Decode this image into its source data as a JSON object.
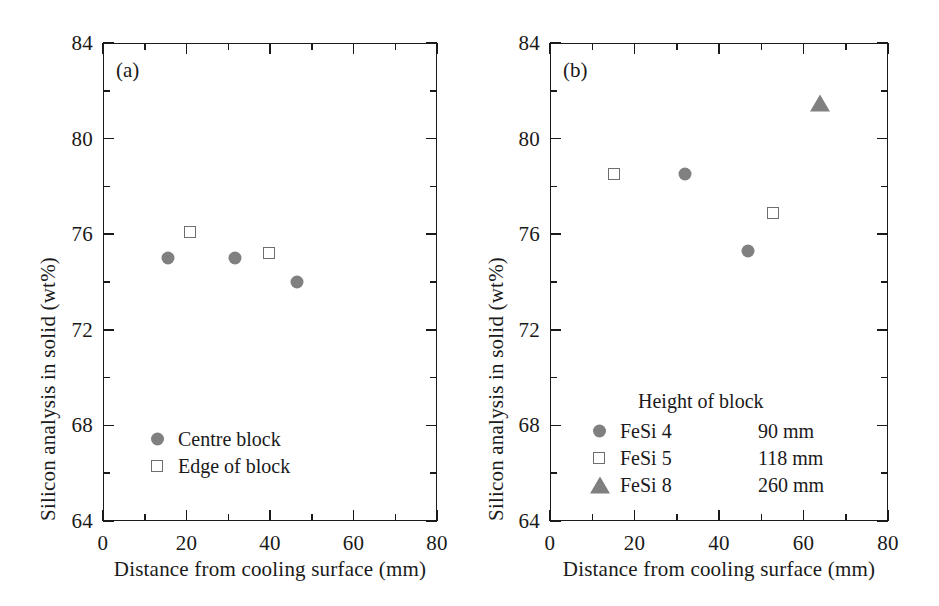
{
  "figure": {
    "panels": [
      {
        "tag": "(a)",
        "xlabel": "Distance from cooling surface (mm)",
        "ylabel": "Silicon analysis in solid (wt%)",
        "xticks": [
          "0",
          "20",
          "40",
          "60",
          "80"
        ],
        "yticks": [
          "64",
          "68",
          "72",
          "76",
          "80",
          "84"
        ],
        "legend": {
          "rows": [
            {
              "symbol": "filled-circle",
              "label": "Centre block"
            },
            {
              "symbol": "open-square",
              "label": "Edge of block"
            }
          ]
        }
      },
      {
        "tag": "(b)",
        "xlabel": "Distance from cooling surface (mm)",
        "ylabel": "Silicon analysis in solid (wt%)",
        "xticks": [
          "0",
          "20",
          "40",
          "60",
          "80"
        ],
        "yticks": [
          "64",
          "68",
          "72",
          "76",
          "80",
          "84"
        ],
        "legend": {
          "header": "Height of block",
          "rows": [
            {
              "symbol": "filled-circle",
              "label": "FeSi 4",
              "value": "90 mm"
            },
            {
              "symbol": "open-square",
              "label": "FeSi 5",
              "value": "118 mm"
            },
            {
              "symbol": "filled-triangle",
              "label": "FeSi 8",
              "value": "260 mm"
            }
          ]
        }
      }
    ]
  },
  "chart_data": [
    {
      "type": "scatter",
      "panel": "(a)",
      "title": "",
      "xlabel": "Distance from cooling surface (mm)",
      "ylabel": "Silicon analysis in solid (wt%)",
      "xlim": [
        0,
        80
      ],
      "ylim": [
        64,
        84
      ],
      "xticks": [
        0,
        20,
        40,
        60,
        80
      ],
      "yticks": [
        64,
        68,
        72,
        76,
        80,
        84
      ],
      "xminor_step": 10,
      "yminor_step": 2,
      "grid": false,
      "legend_position": "lower-left-inside",
      "series": [
        {
          "name": "Centre block",
          "marker": "filled-circle",
          "color": "#808080",
          "x": [
            15.6,
            31.6,
            46.5
          ],
          "y": [
            75.0,
            75.0,
            74.0
          ]
        },
        {
          "name": "Edge of block",
          "marker": "open-square",
          "color": "#6e6e6e",
          "x": [
            20.8,
            39.8
          ],
          "y": [
            76.1,
            75.2
          ]
        }
      ]
    },
    {
      "type": "scatter",
      "panel": "(b)",
      "title": "",
      "xlabel": "Distance from cooling surface (mm)",
      "ylabel": "Silicon analysis in solid (wt%)",
      "xlim": [
        0,
        80
      ],
      "ylim": [
        64,
        84
      ],
      "xticks": [
        0,
        20,
        40,
        60,
        80
      ],
      "yticks": [
        64,
        68,
        72,
        76,
        80,
        84
      ],
      "xminor_step": 10,
      "yminor_step": 2,
      "grid": false,
      "legend_position": "lower-center-inside",
      "legend_title": "Height of block",
      "series": [
        {
          "name": "FeSi 4",
          "height_of_block": "90 mm",
          "marker": "filled-circle",
          "color": "#808080",
          "x": [
            31.9,
            46.8
          ],
          "y": [
            78.5,
            75.3
          ]
        },
        {
          "name": "FeSi 5",
          "height_of_block": "118 mm",
          "marker": "open-square",
          "color": "#6e6e6e",
          "x": [
            15.1,
            52.8
          ],
          "y": [
            78.5,
            76.9
          ]
        },
        {
          "name": "FeSi 8",
          "height_of_block": "260 mm",
          "marker": "filled-triangle",
          "color": "#808080",
          "x": [
            63.9
          ],
          "y": [
            81.5
          ]
        }
      ]
    }
  ]
}
